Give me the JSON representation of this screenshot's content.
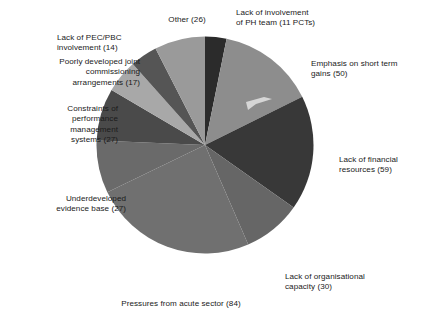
{
  "chart_data": {
    "type": "pie",
    "title": "",
    "subtitle": "",
    "xlabel": "",
    "ylabel": "",
    "legend_position": "none",
    "grid": false,
    "total": 345,
    "start_angle_deg": 0,
    "direction": "clockwise",
    "categories": [
      "Lack of involvement of PH team (11 PCTs)",
      "Emphasis on short term gains (50)",
      "Lack of financial resources  (59)",
      "Lack of organisational capacity (30)",
      "Pressures from acute sector (84)",
      "Underdeveloped evidence base (27)",
      "Constraints of performance management systems (27)",
      "Poorly developed joint commissioning arrangements (17)",
      "Lack of PEC/PBC involvement (14)",
      "Other (26)"
    ],
    "values": [
      11,
      50,
      59,
      30,
      84,
      27,
      27,
      17,
      14,
      26
    ],
    "colors": [
      "#2b2b2b",
      "#8d8d8d",
      "#383838",
      "#666666",
      "#707070",
      "#6a6a6a",
      "#4a4a4a",
      "#a8a8a8",
      "#555555",
      "#9a9a9a"
    ],
    "slices": [
      {
        "label": "Lack of involvement\nof PH team (11 PCTs)",
        "value": 11,
        "color": "#2b2b2b"
      },
      {
        "label": "Emphasis on short term\ngains (50)",
        "value": 50,
        "color": "#8d8d8d"
      },
      {
        "label": "Lack of financial\nresources  (59)",
        "value": 59,
        "color": "#383838"
      },
      {
        "label": "Lack of organisational\ncapacity (30)",
        "value": 30,
        "color": "#666666"
      },
      {
        "label": "Pressures from acute sector (84)",
        "value": 84,
        "color": "#707070"
      },
      {
        "label": "Underdeveloped\nevidence base (27)",
        "value": 27,
        "color": "#6a6a6a"
      },
      {
        "label": "Constraints of\nperformance\nmanagement\nsystems (27)",
        "value": 27,
        "color": "#4a4a4a"
      },
      {
        "label": "Poorly developed joint\ncommissioning\narrangements (17)",
        "value": 17,
        "color": "#a8a8a8"
      },
      {
        "label": "Lack of PEC/PBC\ninvolvement (14)",
        "value": 14,
        "color": "#555555"
      },
      {
        "label": "Other (26)",
        "value": 26,
        "color": "#9a9a9a"
      }
    ]
  },
  "labels": {
    "ph_team": "Lack of involvement\nof PH team (11 PCTs)",
    "short_term": "Emphasis on short term\ngains (50)",
    "financial": "Lack of financial\nresources  (59)",
    "organisational": "Lack of organisational\ncapacity (30)",
    "acute": "Pressures from acute sector (84)",
    "evidence": "Underdeveloped\nevidence base (27)",
    "performance": "Constraints of\nperformance\nmanagement\nsystems (27)",
    "joint": "Poorly developed joint\ncommissioning\narrangements (17)",
    "pec_pbc": "Lack of PEC/PBC\ninvolvement (14)",
    "other": "Other (26)"
  }
}
